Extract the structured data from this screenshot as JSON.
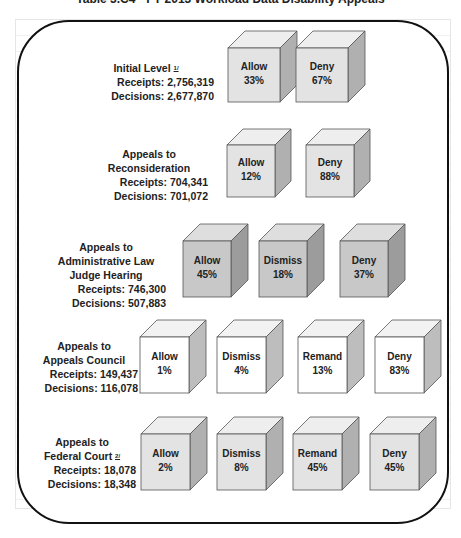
{
  "title": "Table 3.C4 - FY 2013 Workload Data Disability Appeals",
  "colors": {
    "gray_front": "#c8c8c8",
    "gray_top": "#dedede",
    "gray_side": "#9c9c9c",
    "white_front": "#ffffff",
    "white_top": "#f2f2f2",
    "white_side": "#bdbdbd",
    "light_front": "#e3e3e3",
    "light_top": "#eeeeee",
    "light_side": "#b0b0b0",
    "frame": "#111111"
  },
  "levels": [
    {
      "name_lines": [
        "Initial Level"
      ],
      "footnote": "1/",
      "receipts_label": "Receipts:",
      "receipts": "2,756,319",
      "decisions_label": "Decisions:",
      "decisions": "2,677,870",
      "outcomes": [
        {
          "label": "Allow",
          "pct": "33%"
        },
        {
          "label": "Deny",
          "pct": "67%"
        }
      ]
    },
    {
      "name_lines": [
        "Appeals to",
        "Reconsideration"
      ],
      "receipts_label": "Receipts:",
      "receipts": "704,341",
      "decisions_label": "Decisions:",
      "decisions": "701,072",
      "outcomes": [
        {
          "label": "Allow",
          "pct": "12%"
        },
        {
          "label": "Deny",
          "pct": "88%"
        }
      ]
    },
    {
      "name_lines": [
        "Appeals to",
        "Administrative Law",
        "Judge Hearing"
      ],
      "receipts_label": "Receipts:",
      "receipts": "746,300",
      "decisions_label": "Decisions:",
      "decisions": "507,883",
      "outcomes": [
        {
          "label": "Allow",
          "pct": "45%"
        },
        {
          "label": "Dismiss",
          "pct": "18%"
        },
        {
          "label": "Deny",
          "pct": "37%"
        }
      ]
    },
    {
      "name_lines": [
        "Appeals to",
        "Appeals Council"
      ],
      "receipts_label": "Receipts:",
      "receipts": "149,437",
      "decisions_label": "Decisions:",
      "decisions": "116,078",
      "outcomes": [
        {
          "label": "Allow",
          "pct": "1%"
        },
        {
          "label": "Dismiss",
          "pct": "4%"
        },
        {
          "label": "Remand",
          "pct": "13%"
        },
        {
          "label": "Deny",
          "pct": "83%"
        }
      ]
    },
    {
      "name_lines": [
        "Appeals to",
        "Federal Court"
      ],
      "footnote": "2/",
      "receipts_label": "Receipts:",
      "receipts": "18,078",
      "decisions_label": "Decisions:",
      "decisions": "18,348",
      "outcomes": [
        {
          "label": "Allow",
          "pct": "2%"
        },
        {
          "label": "Dismiss",
          "pct": "8%"
        },
        {
          "label": "Remand",
          "pct": "45%"
        },
        {
          "label": "Deny",
          "pct": "45%"
        }
      ]
    }
  ]
}
